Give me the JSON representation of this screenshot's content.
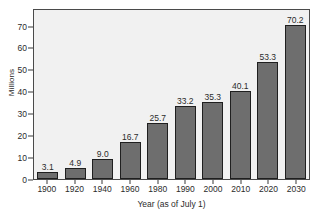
{
  "chart_data": {
    "type": "bar",
    "title": "",
    "subtitle": "",
    "xlabel": "Year (as of July 1)",
    "ylabel": "Millions",
    "categories": [
      "1900",
      "1920",
      "1940",
      "1960",
      "1980",
      "1990",
      "2000",
      "2010",
      "2020",
      "2030"
    ],
    "values": [
      3.1,
      4.9,
      9.0,
      16.7,
      25.7,
      33.2,
      35.3,
      40.1,
      53.3,
      70.2
    ],
    "value_labels": [
      "3.1",
      "4.9",
      "9.0",
      "16.7",
      "25.7",
      "33.2",
      "35.3",
      "40.1",
      "53.3",
      "70.2"
    ],
    "ylim": [
      0,
      78
    ],
    "yticks": [
      0,
      10,
      20,
      30,
      40,
      50,
      60,
      70
    ],
    "ytick_labels": [
      "0",
      "10",
      "20",
      "30",
      "40",
      "50",
      "60",
      "70"
    ],
    "grid": false,
    "legend": null,
    "legend_position": "none",
    "bar_color": "#6e6e6e",
    "bar_edge_color": "#1f1f1f",
    "plot_background": "#f1f1f1",
    "frame_color": "#4a4a4a",
    "text_color": "#2b2b2b",
    "annotations": []
  }
}
